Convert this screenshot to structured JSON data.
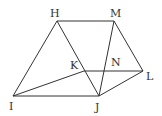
{
  "diagram": {
    "type": "geometry",
    "stroke_color": "#333333",
    "points": [
      {
        "id": "H",
        "label": "H",
        "x": 57,
        "y": 21,
        "label_x": 50,
        "label_y": 17
      },
      {
        "id": "M",
        "label": "M",
        "x": 114,
        "y": 21,
        "label_x": 110,
        "label_y": 17
      },
      {
        "id": "K",
        "label": "K",
        "x": 84,
        "y": 71,
        "label_x": 70,
        "label_y": 69
      },
      {
        "id": "N",
        "label": "N",
        "x": 104,
        "y": 71,
        "label_x": 111,
        "label_y": 66
      },
      {
        "id": "L",
        "label": "L",
        "x": 143,
        "y": 71,
        "label_x": 146,
        "label_y": 80
      },
      {
        "id": "I",
        "label": "I",
        "x": 13,
        "y": 96,
        "label_x": 9,
        "label_y": 110
      },
      {
        "id": "J",
        "label": "J",
        "x": 99,
        "y": 96,
        "label_x": 95,
        "label_y": 111
      }
    ],
    "segments": [
      [
        "H",
        "M"
      ],
      [
        "H",
        "I"
      ],
      [
        "H",
        "J"
      ],
      [
        "M",
        "J"
      ],
      [
        "M",
        "L"
      ],
      [
        "I",
        "J"
      ],
      [
        "I",
        "K"
      ],
      [
        "K",
        "L"
      ],
      [
        "J",
        "L"
      ]
    ]
  }
}
